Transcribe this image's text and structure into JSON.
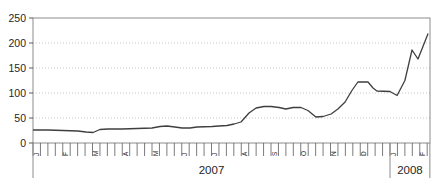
{
  "chart_data": {
    "type": "line",
    "title": "",
    "xlabel": "",
    "ylabel": "",
    "grid": "dotted-horizontal",
    "legend": "none",
    "y_axis": {
      "min": 0,
      "max": 250,
      "tick_step": 50,
      "tick_labels": [
        "0",
        "50",
        "100",
        "150",
        "200",
        "250"
      ]
    },
    "x_axis": {
      "minor_tick_unit": "week",
      "years": [
        {
          "label": "2007",
          "start_month": 0,
          "months": [
            "J",
            "F",
            "M",
            "A",
            "M",
            "J",
            "J",
            "A",
            "S",
            "O",
            "N",
            "D"
          ]
        },
        {
          "label": "2008",
          "start_month": 12,
          "months": [
            "J",
            "F"
          ]
        }
      ],
      "total_months": 13.34
    },
    "series": [
      {
        "points_note": "x = months since Jan 2007 (fractional), y = value",
        "points": [
          [
            0.0,
            26
          ],
          [
            0.5,
            26
          ],
          [
            1.01,
            25
          ],
          [
            1.51,
            24
          ],
          [
            1.78,
            22
          ],
          [
            2.02,
            21
          ],
          [
            2.25,
            27
          ],
          [
            2.52,
            28
          ],
          [
            2.99,
            28
          ],
          [
            3.5,
            29
          ],
          [
            4.0,
            30
          ],
          [
            4.27,
            33
          ],
          [
            4.5,
            34
          ],
          [
            4.77,
            32
          ],
          [
            5.01,
            30
          ],
          [
            5.28,
            30
          ],
          [
            5.51,
            32
          ],
          [
            6.02,
            33
          ],
          [
            6.25,
            34
          ],
          [
            6.52,
            35
          ],
          [
            6.76,
            38
          ],
          [
            6.99,
            42
          ],
          [
            7.26,
            60
          ],
          [
            7.5,
            70
          ],
          [
            7.76,
            73
          ],
          [
            8.0,
            73
          ],
          [
            8.27,
            71
          ],
          [
            8.5,
            68
          ],
          [
            8.74,
            71
          ],
          [
            9.01,
            71
          ],
          [
            9.24,
            65
          ],
          [
            9.51,
            52
          ],
          [
            9.75,
            53
          ],
          [
            10.02,
            58
          ],
          [
            10.25,
            68
          ],
          [
            10.49,
            82
          ],
          [
            10.72,
            105
          ],
          [
            10.92,
            122
          ],
          [
            11.26,
            122
          ],
          [
            11.43,
            110
          ],
          [
            11.56,
            104
          ],
          [
            12.0,
            103
          ],
          [
            12.24,
            95
          ],
          [
            12.5,
            125
          ],
          [
            12.74,
            186
          ],
          [
            12.94,
            168
          ],
          [
            13.28,
            219
          ]
        ]
      }
    ]
  },
  "layout_colors": {
    "plot_border": "#8c8c8c",
    "gridline": "#c8c8c8",
    "tick": "#5a5a5a",
    "line": "#3f3f3f",
    "text": "#262626"
  }
}
